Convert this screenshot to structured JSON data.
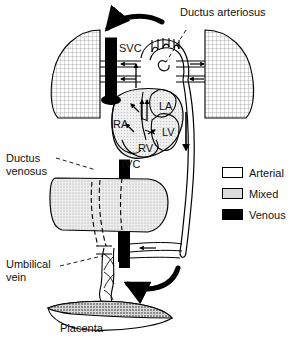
{
  "figure": {
    "caption": "Placenta"
  },
  "labels": {
    "ductus_arteriosus": "Ductus arteriosus",
    "ductus_venosus_line1": "Ductus",
    "ductus_venosus_line2": "venosus",
    "umbilical_vein_line1": "Umbilical",
    "umbilical_vein_line2": "vein",
    "placenta": "Placenta",
    "svc": "SVC",
    "ivc": "IVC",
    "ra": "RA",
    "la": "LA",
    "rv": "RV",
    "lv": "LV"
  },
  "legend": {
    "title": "",
    "items": [
      {
        "label": "Arterial",
        "swatch": "white",
        "color": "#ffffff"
      },
      {
        "label": "Mixed",
        "swatch": "light-gray",
        "color": "#dcdcdc"
      },
      {
        "label": "Venous",
        "swatch": "black",
        "color": "#000000"
      }
    ]
  },
  "colors": {
    "ink": "#000000",
    "arterial": "#ffffff",
    "mixed": "#dcdcdc",
    "venous": "#000000",
    "lung_fill": "#f2f2f2",
    "liver_fill": "#e2e2e2",
    "placenta_fill": "#cccccc",
    "background": "#ffffff"
  },
  "anatomy": {
    "structures": [
      "left lung",
      "right lung",
      "heart",
      "superior vena cava",
      "inferior vena cava",
      "right atrium",
      "left atrium",
      "right ventricle",
      "left ventricle",
      "aortic arch",
      "ductus arteriosus",
      "descending aorta",
      "liver",
      "ductus venosus",
      "umbilical vein",
      "umbilical arteries",
      "umbilical cord",
      "placenta"
    ],
    "flow_arrows": [
      "top curved arrow into superior vena cava",
      "bottom curved arrow into umbilical vein",
      "downward arrow in descending aorta",
      "arrows through foramen ovale",
      "arrows in pulmonary vessels"
    ]
  }
}
